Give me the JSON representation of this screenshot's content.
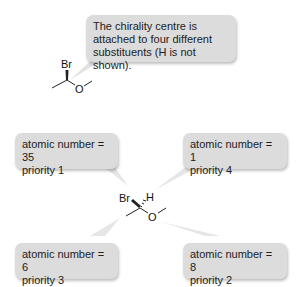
{
  "callout_top": {
    "lines": [
      "The chirality centre is",
      "attached to four different",
      "substituents (H is not shown)."
    ]
  },
  "molecule_top": {
    "br": "Br",
    "o": "O"
  },
  "molecule_center": {
    "br": "Br",
    "h": "H",
    "o": "O"
  },
  "boxes": [
    {
      "line1": "atomic number = 35",
      "line2": "priority 1"
    },
    {
      "line1": "atomic number = 1",
      "line2": "priority 4"
    },
    {
      "line1": "atomic number = 6",
      "line2": "priority 3"
    },
    {
      "line1": "atomic number = 8",
      "line2": "priority 2"
    }
  ],
  "colors": {
    "box_bg": "#dcdcdc",
    "pointer": "#e4e4e4"
  }
}
